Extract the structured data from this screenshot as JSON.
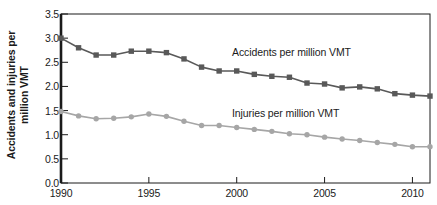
{
  "chart_data": {
    "type": "line",
    "title": "",
    "xlabel": "",
    "ylabel": "Accidents and injuries per million VMT",
    "ylabel_line1": "Accidents and injuries per",
    "ylabel_line2": "million VMT",
    "xlim": [
      1990,
      2011
    ],
    "ylim": [
      0.0,
      3.5
    ],
    "ytick_labels": [
      "0.0",
      "0.5",
      "1.0",
      "1.5",
      "2.0",
      "2.5",
      "3.0",
      "3.5"
    ],
    "ytick_values": [
      0.0,
      0.5,
      1.0,
      1.5,
      2.0,
      2.5,
      3.0,
      3.5
    ],
    "xtick_labels": [
      "1990",
      "1995",
      "2000",
      "2005",
      "2010"
    ],
    "xtick_values": [
      1990,
      1995,
      2000,
      2005,
      2010
    ],
    "grid": false,
    "legend_position": "inline-annotation",
    "x": [
      1990,
      1991,
      1992,
      1993,
      1994,
      1995,
      1996,
      1997,
      1998,
      1999,
      2000,
      2001,
      2002,
      2003,
      2004,
      2005,
      2006,
      2007,
      2008,
      2009,
      2010,
      2011
    ],
    "series": [
      {
        "name": "Accidents per million VMT",
        "color": "#595959",
        "marker": "square",
        "values": [
          3.0,
          2.8,
          2.65,
          2.65,
          2.73,
          2.73,
          2.7,
          2.57,
          2.4,
          2.32,
          2.32,
          2.25,
          2.21,
          2.19,
          2.07,
          2.05,
          1.97,
          1.99,
          1.95,
          1.85,
          1.82,
          1.8
        ]
      },
      {
        "name": "Injuries per million VMT",
        "color": "#a6a6a6",
        "marker": "circle",
        "values": [
          1.48,
          1.39,
          1.33,
          1.34,
          1.37,
          1.43,
          1.38,
          1.28,
          1.19,
          1.19,
          1.15,
          1.11,
          1.07,
          1.02,
          1.0,
          0.95,
          0.91,
          0.88,
          0.84,
          0.8,
          0.75,
          0.75
        ]
      }
    ],
    "annotations": [
      {
        "text": "Accidents per million VMT",
        "x_px": 232,
        "y_px": 47
      },
      {
        "text": "Injuries per million VMT",
        "x_px": 232,
        "y_px": 108
      }
    ]
  }
}
